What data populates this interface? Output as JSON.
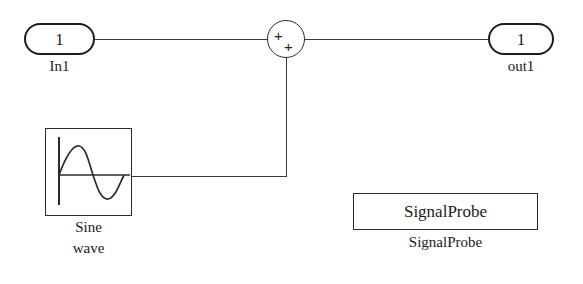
{
  "diagram": {
    "background_color": "#ffffff",
    "line_color": "#3a3a3a",
    "block_border_color": "#2b2b2b",
    "text_color": "#1a1a1a"
  },
  "blocks": {
    "inport": {
      "number": "1",
      "caption": "In1",
      "type": "inport"
    },
    "sum": {
      "sign_top": "+",
      "sign_bottom": "+",
      "caption": "",
      "type": "sum"
    },
    "outport": {
      "number": "1",
      "caption": "out1",
      "type": "outport"
    },
    "sine": {
      "caption_line1": "Sine",
      "caption_line2": "wave",
      "icon": "sine-wave-icon",
      "type": "source"
    },
    "signal_probe": {
      "inner_label": "SignalProbe",
      "caption": "SignalProbe",
      "type": "probe"
    }
  },
  "wires": [
    {
      "name": "in1-to-sum",
      "from": "inport",
      "to": "sum"
    },
    {
      "name": "sum-to-out1",
      "from": "sum",
      "to": "outport"
    },
    {
      "name": "sine-to-sum",
      "from": "sine",
      "to": "sum"
    }
  ]
}
